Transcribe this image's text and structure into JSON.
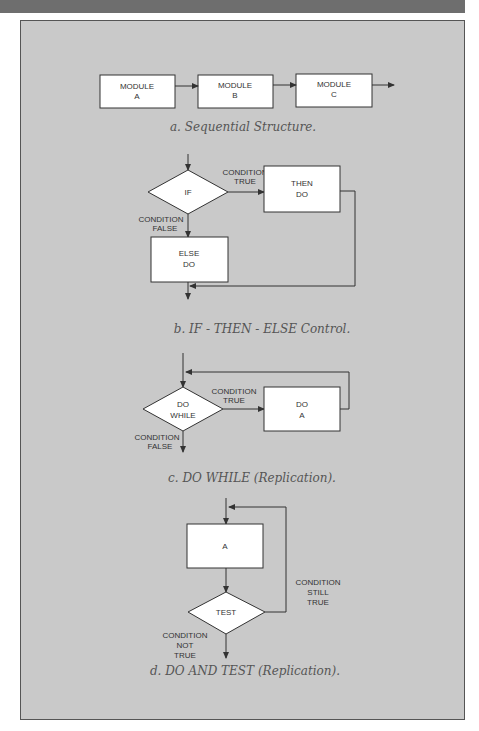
{
  "diagram_a": {
    "modules": [
      {
        "line1": "MODULE",
        "line2": "A"
      },
      {
        "line1": "MODULE",
        "line2": "B"
      },
      {
        "line1": "MODULE",
        "line2": "C"
      }
    ],
    "caption": "a. Sequential Structure."
  },
  "diagram_b": {
    "decision": "IF",
    "true_label": {
      "line1": "CONDITION",
      "line2": "TRUE"
    },
    "false_label": {
      "line1": "CONDITION",
      "line2": "FALSE"
    },
    "then_box": {
      "line1": "THEN",
      "line2": "DO"
    },
    "else_box": {
      "line1": "ELSE",
      "line2": "DO"
    },
    "caption": "b. IF - THEN - ELSE Control."
  },
  "diagram_c": {
    "decision": {
      "line1": "DO",
      "line2": "WHILE"
    },
    "true_label": {
      "line1": "CONDITION",
      "line2": "TRUE"
    },
    "false_label": {
      "line1": "CONDITION",
      "line2": "FALSE"
    },
    "do_box": {
      "line1": "DO",
      "line2": "A"
    },
    "caption": "c. DO WHILE (Replication)."
  },
  "diagram_d": {
    "box": "A",
    "decision": "TEST",
    "loop_label": {
      "line1": "CONDITION",
      "line2": "STILL",
      "line3": "TRUE"
    },
    "exit_label": {
      "line1": "CONDITION",
      "line2": "NOT",
      "line3": "TRUE"
    },
    "caption": "d. DO AND TEST (Replication)."
  }
}
